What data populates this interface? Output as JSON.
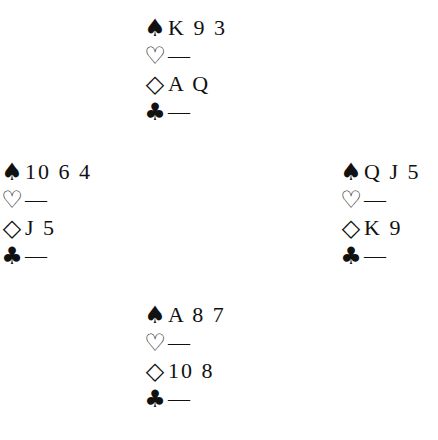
{
  "suits": {
    "spades": "♠",
    "hearts": "♡",
    "diamonds": "◇",
    "clubs": "♣"
  },
  "hands": {
    "north": {
      "spades": "K 9 3",
      "hearts": "—",
      "diamonds": "A Q",
      "clubs": "—"
    },
    "west": {
      "spades": "10 6 4",
      "hearts": "—",
      "diamonds": "J 5",
      "clubs": "—"
    },
    "east": {
      "spades": "Q J 5",
      "hearts": "—",
      "diamonds": "K 9",
      "clubs": "—"
    },
    "south": {
      "spades": "A 8 7",
      "hearts": "—",
      "diamonds": "10 8",
      "clubs": "—"
    }
  }
}
